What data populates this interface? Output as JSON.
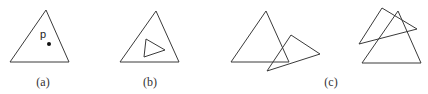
{
  "figure": {
    "panels": [
      {
        "id": "a",
        "caption": "(a)",
        "caption_pos": [
          43,
          86
        ],
        "description": "point p inside triangle",
        "triangles": [
          {
            "points": "46,10 10,62 69,62"
          }
        ],
        "point": {
          "label": "p",
          "label_pos": [
            40,
            38
          ],
          "dot": [
            49,
            44
          ]
        }
      },
      {
        "id": "b",
        "caption": "(b)",
        "caption_pos": [
          150,
          86
        ],
        "description": "small triangle inside larger triangle",
        "triangles": [
          {
            "points": "156,11 120,62 179,62"
          },
          {
            "points": "146,39 144,57 165,50"
          }
        ]
      },
      {
        "id": "c",
        "caption": "(c)",
        "caption_pos": [
          331,
          86
        ],
        "description": "overlapping / intersecting triangles",
        "triangles": [
          {
            "points": "266,11 231,62 289,62"
          },
          {
            "points": "291,35 320,54 267,71"
          },
          {
            "points": "398,11 362,63 421,63"
          },
          {
            "points": "382,8 417,29 359,44"
          }
        ]
      }
    ],
    "colors": {
      "stroke": "#3a3a3a",
      "dot": "#111111",
      "text": "#333333",
      "background": "#ffffff"
    }
  }
}
